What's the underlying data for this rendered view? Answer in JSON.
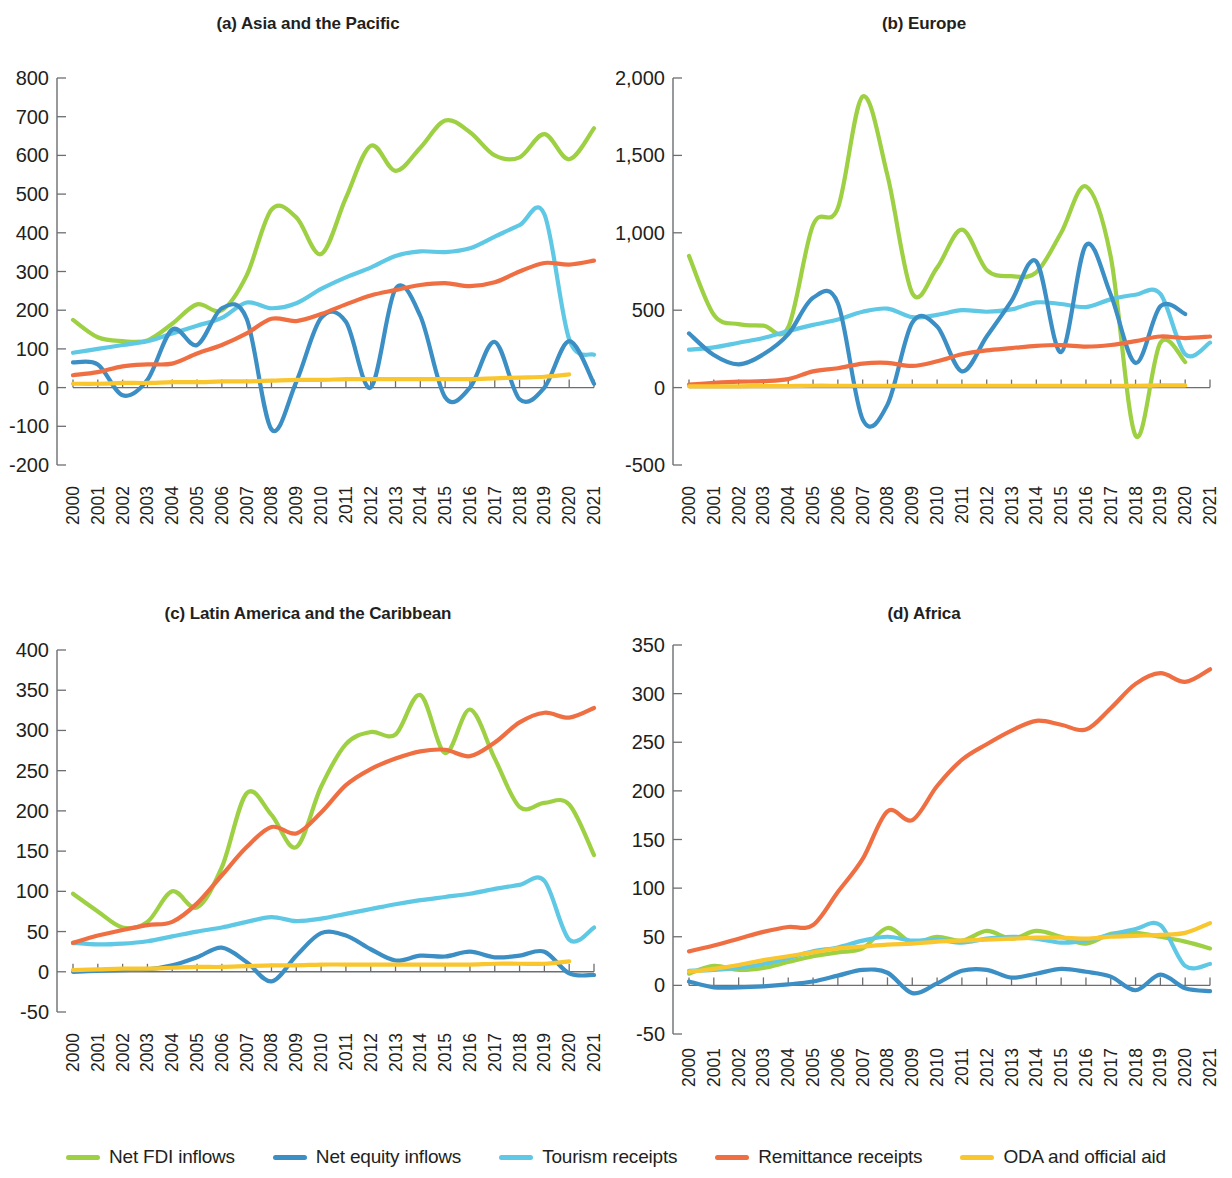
{
  "figure": {
    "panels": [
      {
        "id": "a",
        "title": "(a) Asia and the Pacific"
      },
      {
        "id": "b",
        "title": "(b) Europe"
      },
      {
        "id": "c",
        "title": "(c) Latin America and the Caribbean"
      },
      {
        "id": "d",
        "title": "(d) Africa"
      }
    ]
  },
  "legend": {
    "position": "bottom",
    "items": [
      {
        "label": "Net FDI inflows",
        "color": "#9ed044",
        "key": "net_fdi_inflows"
      },
      {
        "label": "Net equity inflows",
        "color": "#3b8fc4",
        "key": "net_equity_inflows"
      },
      {
        "label": "Tourism receipts",
        "color": "#5ec8e5",
        "key": "tourism_receipts"
      },
      {
        "label": "Remittance receipts",
        "color": "#ef6f43",
        "key": "remittance_receipts"
      },
      {
        "label": "ODA and official aid",
        "color": "#f9c62e",
        "key": "oda_and_official_aid"
      }
    ]
  },
  "chart_data": [
    {
      "type": "line",
      "panel": "a",
      "title": "(a) Asia and the Pacific",
      "xlabel": "",
      "ylabel": "",
      "grid": false,
      "legend_position": "bottom-shared",
      "x": [
        2000,
        2001,
        2002,
        2003,
        2004,
        2005,
        2006,
        2007,
        2008,
        2009,
        2010,
        2011,
        2012,
        2013,
        2014,
        2015,
        2016,
        2017,
        2018,
        2019,
        2020,
        2021
      ],
      "xtick_labels": [
        "2000",
        "2001",
        "2002",
        "2003",
        "2004",
        "2005",
        "2006",
        "2007",
        "2008",
        "2009",
        "2010",
        "2011",
        "2012",
        "2013",
        "2014",
        "2015",
        "2016",
        "2017",
        "2018",
        "2019",
        "2020",
        "2021"
      ],
      "ylim": [
        -200,
        800
      ],
      "ytick_labels": [
        "800",
        "700",
        "600",
        "500",
        "400",
        "300",
        "200",
        "100",
        "0",
        "-100",
        "-200"
      ],
      "yticks": [
        800,
        700,
        600,
        500,
        400,
        300,
        200,
        100,
        0,
        -100,
        -200
      ],
      "series": [
        {
          "name": "Net FDI inflows",
          "color": "#9ed044",
          "values": [
            175,
            130,
            120,
            122,
            165,
            215,
            200,
            290,
            460,
            440,
            345,
            490,
            625,
            560,
            620,
            690,
            660,
            600,
            595,
            655,
            590,
            670
          ]
        },
        {
          "name": "Net equity inflows",
          "color": "#3b8fc4",
          "values": [
            65,
            60,
            -20,
            20,
            150,
            110,
            205,
            178,
            -108,
            15,
            180,
            170,
            0,
            255,
            185,
            -25,
            0,
            118,
            -30,
            0,
            120,
            10
          ]
        },
        {
          "name": "Tourism receipts",
          "color": "#5ec8e5",
          "values": [
            90,
            100,
            110,
            120,
            140,
            160,
            180,
            220,
            205,
            218,
            255,
            285,
            310,
            340,
            352,
            350,
            360,
            390,
            420,
            448,
            125,
            85
          ]
        },
        {
          "name": "Remittance receipts",
          "color": "#ef6f43",
          "values": [
            32,
            40,
            55,
            60,
            62,
            88,
            110,
            140,
            178,
            172,
            190,
            215,
            238,
            252,
            265,
            270,
            262,
            272,
            300,
            322,
            318,
            328
          ]
        },
        {
          "name": "ODA and official aid",
          "color": "#f9c62e",
          "values": [
            10,
            10,
            12,
            12,
            14,
            14,
            16,
            16,
            18,
            20,
            20,
            22,
            22,
            22,
            22,
            22,
            22,
            24,
            26,
            28,
            34,
            null
          ]
        }
      ]
    },
    {
      "type": "line",
      "panel": "b",
      "title": "(b) Europe",
      "xlabel": "",
      "ylabel": "",
      "grid": false,
      "legend_position": "bottom-shared",
      "x": [
        2000,
        2001,
        2002,
        2003,
        2004,
        2005,
        2006,
        2007,
        2008,
        2009,
        2010,
        2011,
        2012,
        2013,
        2014,
        2015,
        2016,
        2017,
        2018,
        2019,
        2020,
        2021
      ],
      "xtick_labels": [
        "2000",
        "2001",
        "2002",
        "2003",
        "2004",
        "2005",
        "2006",
        "2007",
        "2008",
        "2009",
        "2010",
        "2011",
        "2012",
        "2013",
        "2014",
        "2015",
        "2016",
        "2017",
        "2018",
        "2019",
        "2020",
        "2021"
      ],
      "ylim": [
        -500,
        2000
      ],
      "ytick_labels": [
        "2,000",
        "1,500",
        "1,000",
        "500",
        "0",
        "-500"
      ],
      "yticks": [
        2000,
        1500,
        1000,
        500,
        0,
        -500
      ],
      "series": [
        {
          "name": "Net FDI inflows",
          "color": "#9ed044",
          "values": [
            850,
            470,
            410,
            400,
            390,
            1050,
            1160,
            1880,
            1370,
            610,
            775,
            1020,
            760,
            720,
            745,
            1000,
            1300,
            845,
            -310,
            290,
            165,
            null
          ]
        },
        {
          "name": "Net equity inflows",
          "color": "#3b8fc4",
          "values": [
            350,
            210,
            150,
            215,
            345,
            580,
            545,
            -205,
            -110,
            420,
            395,
            105,
            330,
            560,
            815,
            230,
            920,
            600,
            160,
            525,
            475,
            null
          ]
        },
        {
          "name": "Tourism receipts",
          "color": "#5ec8e5",
          "values": [
            245,
            260,
            290,
            320,
            365,
            405,
            440,
            490,
            510,
            455,
            470,
            500,
            490,
            505,
            550,
            540,
            520,
            570,
            600,
            605,
            215,
            290
          ]
        },
        {
          "name": "Remittance receipts",
          "color": "#ef6f43",
          "values": [
            20,
            30,
            38,
            42,
            55,
            105,
            125,
            155,
            160,
            140,
            170,
            215,
            240,
            255,
            270,
            275,
            265,
            275,
            300,
            330,
            320,
            330
          ]
        },
        {
          "name": "ODA and official aid",
          "color": "#f9c62e",
          "values": [
            8,
            8,
            8,
            10,
            10,
            12,
            12,
            12,
            12,
            12,
            12,
            12,
            12,
            12,
            12,
            12,
            12,
            12,
            12,
            14,
            14,
            null
          ]
        }
      ]
    },
    {
      "type": "line",
      "panel": "c",
      "title": "(c) Latin America and the Caribbean",
      "xlabel": "",
      "ylabel": "",
      "grid": false,
      "legend_position": "bottom-shared",
      "x": [
        2000,
        2001,
        2002,
        2003,
        2004,
        2005,
        2006,
        2007,
        2008,
        2009,
        2010,
        2011,
        2012,
        2013,
        2014,
        2015,
        2016,
        2017,
        2018,
        2019,
        2020,
        2021
      ],
      "xtick_labels": [
        "2000",
        "2001",
        "2002",
        "2003",
        "2004",
        "2005",
        "2006",
        "2007",
        "2008",
        "2009",
        "2010",
        "2011",
        "2012",
        "2013",
        "2014",
        "2015",
        "2016",
        "2017",
        "2018",
        "2019",
        "2020",
        "2021"
      ],
      "ylim": [
        -50,
        400
      ],
      "ytick_labels": [
        "400",
        "350",
        "300",
        "250",
        "200",
        "150",
        "100",
        "50",
        "0",
        "-50"
      ],
      "yticks": [
        400,
        350,
        300,
        250,
        200,
        150,
        100,
        50,
        0,
        -50
      ],
      "series": [
        {
          "name": "Net FDI inflows",
          "color": "#9ed044",
          "values": [
            97,
            75,
            55,
            62,
            100,
            80,
            130,
            222,
            195,
            155,
            230,
            283,
            298,
            295,
            344,
            272,
            326,
            265,
            205,
            210,
            208,
            145
          ]
        },
        {
          "name": "Net equity inflows",
          "color": "#3b8fc4",
          "values": [
            0,
            1,
            2,
            3,
            8,
            18,
            30,
            12,
            -12,
            20,
            48,
            45,
            28,
            14,
            20,
            19,
            25,
            18,
            20,
            25,
            -2,
            -4
          ]
        },
        {
          "name": "Tourism receipts",
          "color": "#5ec8e5",
          "values": [
            36,
            34,
            35,
            38,
            44,
            50,
            55,
            62,
            68,
            63,
            66,
            72,
            78,
            84,
            89,
            93,
            97,
            103,
            108,
            113,
            40,
            55
          ]
        },
        {
          "name": "Remittance receipts",
          "color": "#ef6f43",
          "values": [
            36,
            45,
            52,
            58,
            62,
            85,
            120,
            155,
            180,
            172,
            198,
            232,
            252,
            265,
            274,
            276,
            268,
            285,
            310,
            322,
            316,
            328
          ]
        },
        {
          "name": "ODA and official aid",
          "color": "#f9c62e",
          "values": [
            2,
            3,
            4,
            4,
            5,
            6,
            6,
            7,
            8,
            8,
            9,
            9,
            9,
            9,
            9,
            9,
            9,
            10,
            10,
            10,
            13,
            null
          ]
        }
      ]
    },
    {
      "type": "line",
      "panel": "d",
      "title": "(d) Africa",
      "xlabel": "",
      "ylabel": "",
      "grid": false,
      "legend_position": "bottom-shared",
      "x": [
        2000,
        2001,
        2002,
        2003,
        2004,
        2005,
        2006,
        2007,
        2008,
        2009,
        2010,
        2011,
        2012,
        2013,
        2014,
        2015,
        2016,
        2017,
        2018,
        2019,
        2020,
        2021
      ],
      "xtick_labels": [
        "2000",
        "2001",
        "2002",
        "2003",
        "2004",
        "2005",
        "2006",
        "2007",
        "2008",
        "2009",
        "2010",
        "2011",
        "2012",
        "2013",
        "2014",
        "2015",
        "2016",
        "2017",
        "2018",
        "2019",
        "2020",
        "2021"
      ],
      "ylim": [
        -50,
        350
      ],
      "ytick_labels": [
        "350",
        "300",
        "250",
        "200",
        "150",
        "100",
        "50",
        "0",
        "-50"
      ],
      "yticks": [
        350,
        300,
        250,
        200,
        150,
        100,
        50,
        0,
        -50
      ],
      "series": [
        {
          "name": "Net FDI inflows",
          "color": "#9ed044",
          "values": [
            12,
            20,
            16,
            18,
            24,
            30,
            34,
            38,
            59,
            44,
            50,
            46,
            56,
            48,
            56,
            50,
            43,
            53,
            54,
            50,
            45,
            38
          ]
        },
        {
          "name": "Net equity inflows",
          "color": "#3b8fc4",
          "values": [
            4,
            -2,
            -2,
            -1,
            1,
            4,
            10,
            16,
            13,
            -8,
            2,
            15,
            16,
            8,
            12,
            17,
            14,
            9,
            -5,
            11,
            -3,
            -6
          ]
        },
        {
          "name": "Tourism receipts",
          "color": "#5ec8e5",
          "values": [
            15,
            16,
            18,
            22,
            28,
            35,
            39,
            46,
            50,
            46,
            47,
            44,
            48,
            50,
            48,
            44,
            46,
            52,
            58,
            62,
            20,
            22
          ]
        },
        {
          "name": "Remittance receipts",
          "color": "#ef6f43",
          "values": [
            35,
            41,
            48,
            55,
            60,
            62,
            96,
            130,
            179,
            170,
            205,
            232,
            248,
            262,
            272,
            268,
            263,
            285,
            310,
            321,
            312,
            325
          ]
        },
        {
          "name": "ODA and official aid",
          "color": "#f9c62e",
          "values": [
            14,
            17,
            21,
            26,
            30,
            34,
            38,
            40,
            42,
            43,
            45,
            46,
            47,
            48,
            49,
            49,
            48,
            50,
            51,
            52,
            54,
            64
          ]
        }
      ]
    }
  ]
}
